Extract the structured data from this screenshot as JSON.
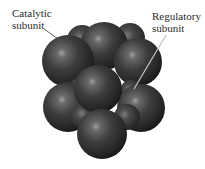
{
  "figure": {
    "labels": {
      "catalytic": {
        "line1": "Catalytic",
        "line2": "subunit"
      },
      "regulatory": {
        "line1": "Regulatory",
        "line2": "subunit"
      }
    },
    "colors": {
      "background": "#ffffff",
      "sphere_dark": "#1a1a1a",
      "sphere_mid": "#3c3c3c",
      "sphere_highlight": "#9a9a9a",
      "label_text": "#2a2a2a",
      "catalytic_leader": "#555555",
      "regulatory_leader": "#bdbdbd"
    }
  }
}
